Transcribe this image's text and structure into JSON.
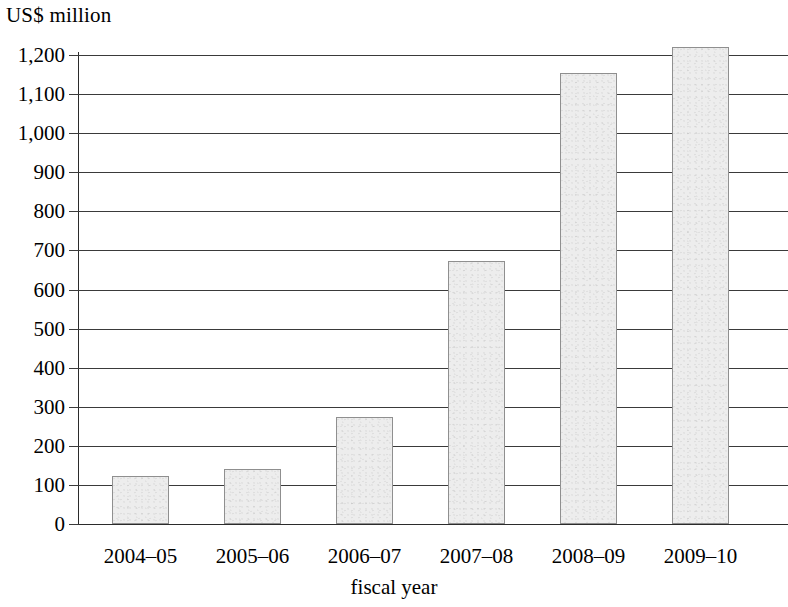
{
  "chart_data": {
    "type": "bar",
    "title": "",
    "ylabel": "US$ million",
    "xlabel": "fiscal year",
    "categories": [
      "2004–05",
      "2005–06",
      "2006–07",
      "2007–08",
      "2008–09",
      "2009–10"
    ],
    "values": [
      122,
      140,
      273,
      672,
      1155,
      1220
    ],
    "ylim": [
      0,
      1200
    ],
    "ytick_values": [
      0,
      100,
      200,
      300,
      400,
      500,
      600,
      700,
      800,
      900,
      1000,
      1100,
      1200
    ],
    "ytick_labels": [
      "0",
      "100",
      "200",
      "300",
      "400",
      "500",
      "600",
      "700",
      "800",
      "900",
      "1,000",
      "1,100",
      "1,200"
    ],
    "grid": true,
    "legend": null,
    "legend_position": "none",
    "bar_fill_color": "#ededed",
    "bar_border_color": "#8f8f8f",
    "axis_color": "#2b2b2b",
    "grid_color": "#3a3a3a",
    "background_color": "#ffffff"
  }
}
